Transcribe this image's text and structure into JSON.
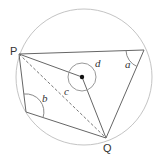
{
  "diagram": {
    "type": "circle-geometry",
    "colors": {
      "circle": "#bdbdbd",
      "lines": "#555555",
      "arcs": "#555555",
      "text": "#333333",
      "dot": "#111111"
    },
    "labels": {
      "P": "P",
      "Q": "Q",
      "a": "a",
      "b": "b",
      "c": "c",
      "d": "d"
    },
    "points": {
      "P": [
        19,
        54
      ],
      "Q": [
        106,
        138
      ],
      "R": [
        144,
        50
      ],
      "S": [
        26,
        112
      ],
      "O": [
        82,
        77
      ]
    },
    "angles": [
      "a",
      "b",
      "c",
      "d"
    ]
  }
}
